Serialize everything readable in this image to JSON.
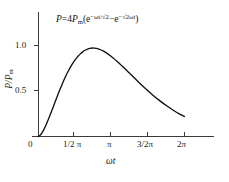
{
  "figure": {
    "annotation": {
      "lhs": "P",
      "equals": "=",
      "coefficient": "4",
      "p_symbol": "P",
      "p_subscript": "m",
      "open_paren": "(",
      "term1_base": "e",
      "term1_exponent": "−ωt/√2",
      "minus": "−",
      "term2_base": "e",
      "term2_exponent": "−√2ωt",
      "close_paren": ")",
      "full_text": "P=4Pm(e^(−ωt/√2) − e^(−√2ωt))"
    },
    "y_axis_label_numerator": "P",
    "y_axis_label_slash": "/",
    "y_axis_label_denominator": "P",
    "y_axis_label_subscript": "m",
    "x_axis_label": "ωt"
  },
  "chart_data": {
    "type": "line",
    "title": "",
    "subtitle": "",
    "xlabel": "ωt",
    "ylabel": "P/Pₘ",
    "annotation": "P=4Pₘ(e⁻ωᵗᐟ√² − e⁻√²ωᵗ)",
    "grid": false,
    "legend": "none",
    "xlim": [
      0,
      6.2832
    ],
    "ylim": [
      0,
      1.15
    ],
    "xtick_values": [
      0,
      1.5708,
      3.1416,
      4.7124,
      6.2832
    ],
    "xtick_labels": [
      "0",
      "1/2 π",
      "π",
      "3/2π",
      "2π"
    ],
    "ytick_values": [
      0,
      0.5,
      1.0
    ],
    "ytick_labels": [
      "0",
      "0.5",
      "1.0"
    ],
    "peak": {
      "x": 1.699,
      "y": 0.97
    },
    "series": [
      {
        "name": "P/Pm",
        "x": [
          0.0,
          0.1,
          0.2,
          0.3,
          0.4,
          0.5,
          0.6,
          0.7,
          0.8,
          0.9,
          1.0,
          1.1,
          1.2,
          1.3,
          1.4,
          1.5,
          1.6,
          1.7,
          1.8,
          1.9,
          2.0,
          2.2,
          2.4,
          2.6,
          2.8,
          3.0,
          3.2,
          3.4,
          3.6,
          3.8,
          4.0,
          4.3,
          4.6,
          4.9,
          5.2,
          5.5,
          5.8,
          6.1,
          6.2832
        ],
        "y": [
          0.0,
          0.022,
          0.062,
          0.113,
          0.172,
          0.236,
          0.303,
          0.37,
          0.437,
          0.502,
          0.564,
          0.623,
          0.678,
          0.728,
          0.774,
          0.815,
          0.851,
          0.882,
          0.908,
          0.93,
          0.948,
          0.969,
          0.972,
          0.961,
          0.938,
          0.905,
          0.866,
          0.822,
          0.774,
          0.725,
          0.675,
          0.6,
          0.528,
          0.46,
          0.397,
          0.34,
          0.289,
          0.244,
          0.22
        ]
      }
    ]
  }
}
